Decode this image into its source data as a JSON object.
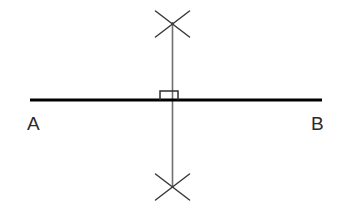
{
  "diagram": {
    "type": "geometric-construction",
    "canvas": {
      "width": 344,
      "height": 207,
      "background": "#ffffff"
    },
    "labels": {
      "point_a": "A",
      "point_b": "B"
    },
    "colors": {
      "base_line": "#000000",
      "construction_line": "#6e6e6e",
      "arc_mark": "#3a3a3a",
      "right_angle_mark": "#2e2e2e",
      "label_text": "#2b2b2b",
      "background": "#ffffff"
    },
    "elements": {
      "base_line": {
        "name": "segment-ab",
        "x1": 30,
        "y1": 100,
        "x2": 322,
        "y2": 100,
        "stroke_width": 3.2
      },
      "perpendicular_line": {
        "name": "perpendicular-bisector",
        "x1": 172.5,
        "y1": 22,
        "x2": 172.5,
        "y2": 188,
        "stroke_width": 1.6
      },
      "arc_mark_top": {
        "name": "arc-intersection-top",
        "cx": 172.5,
        "cy": 24,
        "half_width": 17,
        "half_height": 13,
        "stroke_width": 1.5
      },
      "arc_mark_bottom": {
        "name": "arc-intersection-bottom",
        "cx": 172.5,
        "cy": 187,
        "half_width": 17,
        "half_height": 13,
        "stroke_width": 1.5
      },
      "right_angle_mark": {
        "name": "right-angle-square",
        "x": 160,
        "y": 91,
        "width": 18,
        "height": 9,
        "stroke_width": 1.5
      }
    },
    "label_positions": {
      "point_a": {
        "x": 27,
        "y": 114
      },
      "point_b": {
        "x": 311,
        "y": 114
      }
    }
  }
}
